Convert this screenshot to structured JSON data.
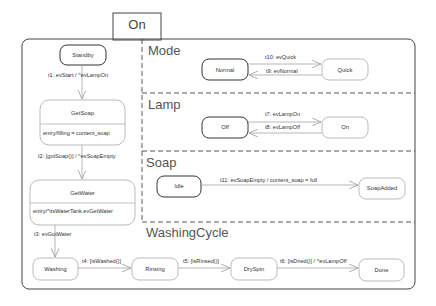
{
  "diagram": {
    "type": "UML state machine",
    "composite_state": {
      "name": "On"
    },
    "left_region": {
      "states": [
        {
          "id": "standby",
          "name": "Standby",
          "initial_style": true
        },
        {
          "id": "getsoap",
          "name": "GetSoap",
          "entry": "entry/filling = content_soap"
        },
        {
          "id": "getwater",
          "name": "GetWater",
          "entry": "entry/^itsWaterTank.evGetWater"
        }
      ],
      "transitions": [
        {
          "id": "t1",
          "label": "t1: evStart / ^evLampOn",
          "from": "Standby",
          "to": "GetSoap"
        },
        {
          "id": "t2",
          "label": "t2: [gotSoap()] / ^evSoapEmpty",
          "from": "GetSoap",
          "to": "GetWater"
        },
        {
          "id": "t3",
          "label": "t3: evGotWater",
          "from": "GetWater",
          "to": "Washing"
        }
      ]
    },
    "regions": [
      {
        "name": "Mode",
        "states": [
          "Normal",
          "Quick"
        ],
        "transitions": [
          {
            "id": "t10",
            "label": "t10: evQuick",
            "from": "Normal",
            "to": "Quick"
          },
          {
            "id": "t9",
            "label": "t9: evNormal",
            "from": "Quick",
            "to": "Normal"
          }
        ]
      },
      {
        "name": "Lamp",
        "states": [
          "Off",
          "On"
        ],
        "transitions": [
          {
            "id": "t7",
            "label": "t7: evLampOn",
            "from": "Off",
            "to": "On"
          },
          {
            "id": "t8",
            "label": "t8: evLampOff",
            "from": "On",
            "to": "Off"
          }
        ]
      },
      {
        "name": "Soap",
        "states": [
          "Idle",
          "SoapAdded"
        ],
        "transitions": [
          {
            "id": "t11",
            "label": "t11: evSoapEmpty / content_soap = full",
            "from": "Idle",
            "to": "SoapAdded"
          }
        ]
      },
      {
        "name": "WashingCycle",
        "states": [
          "Washing",
          "Rinsing",
          "DrySpin",
          "Done"
        ],
        "transitions": [
          {
            "id": "t4",
            "label": "t4: [isWashed()]",
            "from": "Washing",
            "to": "Rinsing"
          },
          {
            "id": "t5",
            "label": "t5: [isRinsed()]",
            "from": "Rinsing",
            "to": "DrySpin"
          },
          {
            "id": "t6",
            "label": "t6: [isDried()] / ^evLampOff",
            "from": "DrySpin",
            "to": "Done"
          }
        ]
      }
    ]
  },
  "labels": {
    "tab": "On",
    "mode": "Mode",
    "lamp": "Lamp",
    "soap": "Soap",
    "washing_cycle": "WashingCycle",
    "standby": "Standby",
    "getsoap": "GetSoap",
    "getsoap_entry": "entry/filling = content_soap",
    "getwater": "GetWater",
    "getwater_entry": "entry/^itsWaterTank.evGetWater",
    "normal": "Normal",
    "quick": "Quick",
    "off": "Off",
    "on": "On",
    "idle": "Idle",
    "soapadded": "SoapAdded",
    "washing": "Washing",
    "rinsing": "Rinsing",
    "dryspin": "DrySpin",
    "done": "Done",
    "t1": "t1: evStart / ^evLampOn",
    "t2": "t2: [gotSoap()] / ^evSoapEmpty",
    "t3": "t3: evGotWater",
    "t4": "t4: [isWashed()]",
    "t5": "t5: [isRinsed()]",
    "t6": "t6: [isDried()] / ^evLampOff",
    "t7": "t7: evLampOn",
    "t8": "t8: evLampOff",
    "t9": "t9: evNormal",
    "t10": "t10: evQuick",
    "t11": "t11: evSoapEmpty / content_soap = full"
  },
  "colors": {
    "line": "#555555",
    "state_border_bold": "#333333",
    "state_border_light": "#9a9a9a",
    "arrow": "#9a9a9a"
  }
}
